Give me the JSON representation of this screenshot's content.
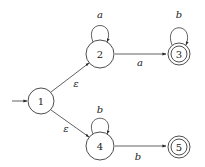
{
  "diagram": {
    "type": "nfa",
    "start_state": "1",
    "states": [
      {
        "id": "1",
        "label": "1",
        "x": 41,
        "y": 101,
        "r": 13,
        "accepting": false
      },
      {
        "id": "2",
        "label": "2",
        "x": 100,
        "y": 54,
        "r": 14,
        "accepting": false
      },
      {
        "id": "3",
        "label": "3",
        "x": 179,
        "y": 54,
        "r": 11,
        "accepting": true
      },
      {
        "id": "4",
        "label": "4",
        "x": 100,
        "y": 146,
        "r": 14,
        "accepting": false
      },
      {
        "id": "5",
        "label": "5",
        "x": 179,
        "y": 147,
        "r": 11,
        "accepting": true
      }
    ],
    "transitions": [
      {
        "from": "1",
        "to": "2",
        "label": "ε",
        "lx": 76,
        "ly": 83
      },
      {
        "from": "1",
        "to": "4",
        "label": "ε",
        "lx": 66,
        "ly": 128
      },
      {
        "from": "2",
        "to": "2",
        "label": "a",
        "lx": 100,
        "ly": 14
      },
      {
        "from": "2",
        "to": "3",
        "label": "a",
        "lx": 140,
        "ly": 62
      },
      {
        "from": "3",
        "to": "3",
        "label": "b",
        "lx": 179,
        "ly": 14
      },
      {
        "from": "4",
        "to": "4",
        "label": "b",
        "lx": 100,
        "ly": 109
      },
      {
        "from": "4",
        "to": "5",
        "label": "b",
        "lx": 138,
        "ly": 156
      }
    ]
  }
}
